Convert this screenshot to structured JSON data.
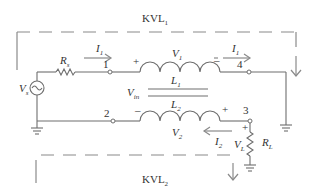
{
  "diagram": {
    "type": "coupled-inductor circuit with KVL loops",
    "loops": [
      {
        "id": "kvl1",
        "label": "KVL",
        "subscript": "1",
        "position": "top"
      },
      {
        "id": "kvl2",
        "label": "KVL",
        "subscript": "2",
        "position": "bottom"
      }
    ],
    "source": {
      "label": "V",
      "subscript": "s",
      "symbol": "ac-source-icon"
    },
    "source_resistor": {
      "label": "R",
      "subscript": "s"
    },
    "load_resistor": {
      "label": "R",
      "subscript": "L"
    },
    "inductors": [
      {
        "label": "L",
        "subscript": "1",
        "voltage_label": "V",
        "voltage_subscript": "1",
        "plus": "+",
        "minus": "–"
      },
      {
        "label": "L",
        "subscript": "2",
        "voltage_label": "V",
        "voltage_subscript": "2",
        "plus": "+",
        "minus": "–"
      }
    ],
    "input_voltage": {
      "label": "V",
      "subscript": "in"
    },
    "load_voltage": {
      "label": "V",
      "subscript": "L",
      "plus": "+"
    },
    "currents": [
      {
        "label": "I",
        "subscript": "1",
        "position": "left-top"
      },
      {
        "label": "I",
        "subscript": "1",
        "position": "right-top"
      },
      {
        "label": "I",
        "subscript": "2",
        "position": "bottom"
      }
    ],
    "nodes": [
      "1",
      "2",
      "3",
      "4"
    ]
  }
}
